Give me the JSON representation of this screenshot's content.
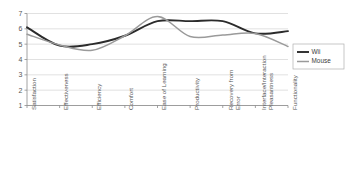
{
  "chart_data": {
    "type": "line",
    "title": "",
    "xlabel": "",
    "ylabel": "",
    "ylim": [
      1,
      7
    ],
    "yticks": [
      1,
      2,
      3,
      4,
      5,
      6,
      7
    ],
    "grid": true,
    "legend_position": "right",
    "categories": [
      "Satisfaction",
      "Effectiveness",
      "Efficiency",
      "Comfort",
      "Ease of Learning",
      "Productivity",
      "Recovery from Error",
      "Interface/Interaction Pleasantness",
      "Functionality"
    ],
    "category_lines": [
      [
        "Satisfaction"
      ],
      [
        "Effectiveness"
      ],
      [
        "Efficiency"
      ],
      [
        "Comfort"
      ],
      [
        "Ease of Learning"
      ],
      [
        "Productivity"
      ],
      [
        "Recovery from",
        "Error"
      ],
      [
        "Interface/Interaction",
        "Pleasantness"
      ],
      [
        "Functionality"
      ]
    ],
    "series": [
      {
        "name": "Wii",
        "color": "#2b2b2b",
        "values": [
          6.1,
          4.9,
          5.0,
          5.55,
          6.5,
          6.5,
          6.5,
          5.7,
          5.85
        ]
      },
      {
        "name": "Mouse",
        "color": "#9a9a9a",
        "values": [
          5.65,
          4.95,
          4.6,
          5.55,
          6.8,
          5.5,
          5.6,
          5.7,
          4.85
        ]
      }
    ]
  },
  "legend": {
    "entries": [
      {
        "label": "Wii"
      },
      {
        "label": "Mouse"
      }
    ]
  }
}
